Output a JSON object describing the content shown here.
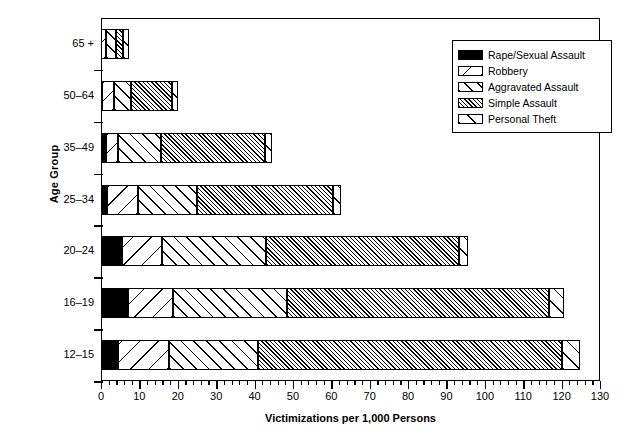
{
  "chart_data": {
    "type": "bar",
    "orientation": "horizontal",
    "stacked": true,
    "title": "",
    "xlabel": "Victimizations per 1,000 Persons",
    "ylabel": "Age Group",
    "xlim": [
      0,
      130
    ],
    "xticks": [
      0,
      10,
      20,
      30,
      40,
      50,
      60,
      70,
      80,
      90,
      100,
      110,
      120,
      130
    ],
    "xtick_labels": [
      "0",
      "10",
      "20",
      "30",
      "40",
      "50",
      "60",
      "70",
      "80",
      "90",
      "100",
      "110",
      "120",
      "130"
    ],
    "minor_tick_step": 2,
    "grid": false,
    "legend_position": "upper right",
    "categories": [
      "65 +",
      "50–64",
      "35–49",
      "25–34",
      "20–24",
      "16–19",
      "12–15"
    ],
    "series": [
      {
        "name": "Rape/Sexual Assault",
        "pattern": "solid-black",
        "values": [
          0.0,
          0.2,
          1.3,
          1.6,
          5.5,
          7.0,
          4.4
        ]
      },
      {
        "name": "Robbery",
        "pattern": "backslash-wide",
        "values": [
          1.3,
          3.2,
          3.1,
          8.0,
          10.5,
          11.8,
          13.3
        ]
      },
      {
        "name": "Aggravated Assault",
        "pattern": "forwardslash",
        "values": [
          2.7,
          4.4,
          11.2,
          15.4,
          27.0,
          29.7,
          23.3
        ]
      },
      {
        "name": "Simple Assault",
        "pattern": "fine-hatch-gray",
        "values": [
          1.8,
          10.7,
          27.1,
          35.4,
          50.3,
          68.2,
          79.0
        ]
      },
      {
        "name": "Personal Theft",
        "pattern": "sparse-slash",
        "values": [
          1.4,
          1.5,
          1.8,
          2.1,
          2.2,
          3.9,
          4.7
        ]
      }
    ],
    "totals": [
      7.2,
      20.0,
      44.5,
      62.5,
      95.5,
      120.6,
      124.7
    ]
  },
  "legend": {
    "items": [
      {
        "label": "Rape/Sexual Assault",
        "swatch": "solid-black-swatch"
      },
      {
        "label": "Robbery",
        "swatch": "backslash-swatch"
      },
      {
        "label": "Aggravated Assault",
        "swatch": "forwardslash-swatch"
      },
      {
        "label": "Simple Assault",
        "swatch": "fine-hatch-swatch"
      },
      {
        "label": "Personal Theft",
        "swatch": "sparse-slash-swatch"
      }
    ]
  }
}
